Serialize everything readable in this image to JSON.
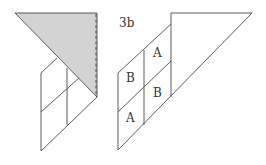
{
  "figure_label": "3b",
  "colors": {
    "line": "#4a4a4a",
    "shaded_triangle": "#d3d3d3",
    "background": "#ffffff"
  },
  "left_figure": {
    "description": "Shaded right triangle folded over a 2x2 grid of parallelograms, dashed fold line on right edge"
  },
  "right_figure": {
    "labels": [
      {
        "text": "A",
        "cell": "top-right"
      },
      {
        "text": "B",
        "cell": "top-left"
      },
      {
        "text": "B",
        "cell": "bottom-right"
      },
      {
        "text": "A",
        "cell": "bottom-left"
      }
    ]
  }
}
